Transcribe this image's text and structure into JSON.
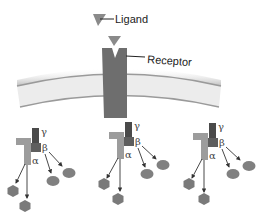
{
  "labels": {
    "ligand": "Ligand",
    "receptor": "Receptor",
    "gamma": "γ",
    "beta": "β",
    "alpha": "α"
  },
  "colors": {
    "ligand": "#8a8a8a",
    "receptor": "#6e6e6e",
    "membrane_fill": "#ececec",
    "membrane_edge": "#9a9a9a",
    "gamma": "#4a4a4a",
    "beta": "#5e5e5e",
    "alpha": "#9c9c9c",
    "effector_hex": "#7a7a7a",
    "effector_ellipse": "#808080",
    "arrow": "#333333"
  },
  "g_protein_complexes": [
    {
      "id": 1,
      "offset_x": 0,
      "offset_y": 0
    },
    {
      "id": 2,
      "offset_x": 92,
      "offset_y": -6
    },
    {
      "id": 3,
      "offset_x": 177,
      "offset_y": -5
    }
  ]
}
